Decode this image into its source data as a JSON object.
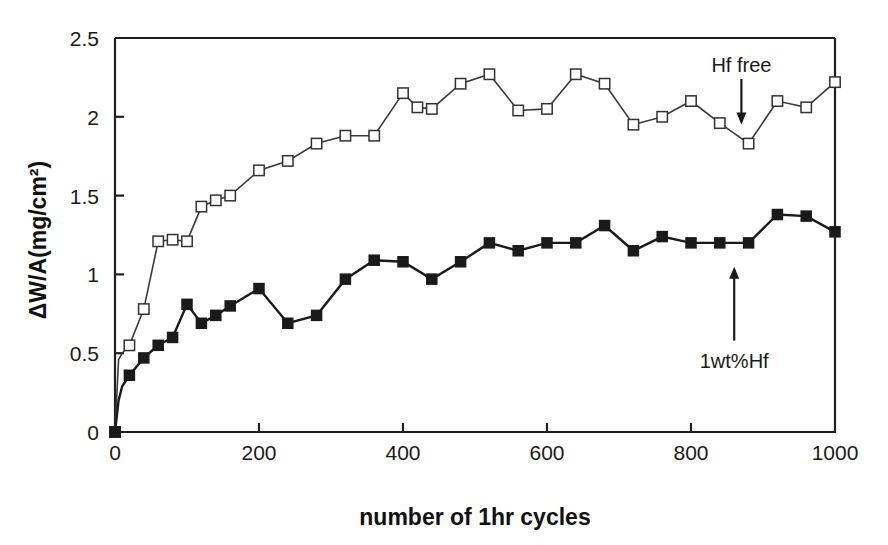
{
  "chart_data": {
    "type": "line",
    "title": "",
    "xlabel": "number of 1hr cycles",
    "ylabel": "ΔW/A(mg/cm²)",
    "xlim": [
      0,
      1000
    ],
    "ylim": [
      0,
      2.5
    ],
    "xticks": [
      0,
      200,
      400,
      600,
      800,
      1000
    ],
    "yticks": [
      0,
      0.5,
      1,
      1.5,
      2,
      2.5
    ],
    "xtick_labels": [
      "0",
      "200",
      "400",
      "600",
      "800",
      "1000"
    ],
    "ytick_labels": [
      "0",
      "0.5",
      "1",
      "1.5",
      "2",
      "2.5"
    ],
    "grid": false,
    "legend": "none",
    "annotations": [
      {
        "text": "Hf free",
        "target_series": "Hf free",
        "arrow_direction": "down",
        "x": 870,
        "label_y": 2.33,
        "arrow_from_y": 2.24,
        "arrow_to_y": 1.97
      },
      {
        "text": "1wt%Hf",
        "target_series": "1wt%Hf",
        "arrow_direction": "up",
        "x": 860,
        "label_y": 0.45,
        "arrow_from_y": 0.58,
        "arrow_to_y": 1.03
      }
    ],
    "series": [
      {
        "name": "Hf free",
        "marker": "open-square",
        "marker_fill": "#ffffff",
        "marker_stroke": "#333333",
        "line_color": "#3a3a3a",
        "x": [
          0,
          5,
          10,
          20,
          40,
          60,
          80,
          100,
          120,
          140,
          160,
          200,
          240,
          280,
          320,
          360,
          400,
          420,
          440,
          480,
          520,
          560,
          600,
          640,
          680,
          720,
          760,
          800,
          840,
          880,
          920,
          960,
          1000
        ],
        "y": [
          0.0,
          0.46,
          0.5,
          0.55,
          0.78,
          1.21,
          1.22,
          1.21,
          1.43,
          1.47,
          1.5,
          1.66,
          1.72,
          1.83,
          1.88,
          1.88,
          2.15,
          2.06,
          2.05,
          2.21,
          2.27,
          2.04,
          2.05,
          2.27,
          2.21,
          1.95,
          2.0,
          2.1,
          1.96,
          1.83,
          2.1,
          2.06,
          2.22
        ]
      },
      {
        "name": "1wt%Hf",
        "marker": "filled-square",
        "marker_fill": "#1a1a1a",
        "marker_stroke": "#1a1a1a",
        "line_color": "#1a1a1a",
        "x": [
          0,
          5,
          10,
          20,
          40,
          60,
          80,
          100,
          120,
          140,
          160,
          200,
          240,
          280,
          320,
          360,
          400,
          440,
          480,
          520,
          560,
          600,
          640,
          680,
          720,
          760,
          800,
          840,
          880,
          920,
          960,
          1000
        ],
        "y": [
          0.0,
          0.2,
          0.29,
          0.36,
          0.47,
          0.55,
          0.6,
          0.81,
          0.69,
          0.74,
          0.8,
          0.91,
          0.69,
          0.74,
          0.97,
          1.09,
          1.08,
          0.97,
          1.08,
          1.2,
          1.15,
          1.2,
          1.2,
          1.31,
          1.15,
          1.24,
          1.2,
          1.2,
          1.2,
          1.38,
          1.37,
          1.27
        ]
      }
    ]
  },
  "figure": {
    "background_color": "#ffffff",
    "axis_color": "#1f1f1f"
  }
}
